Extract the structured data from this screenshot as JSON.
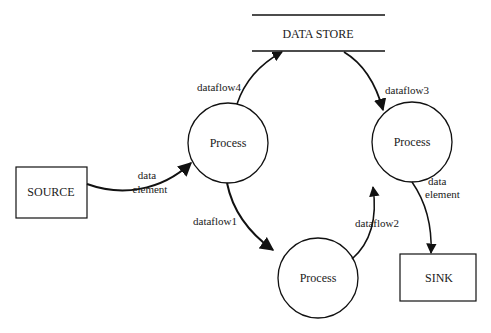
{
  "diagram": {
    "type": "data-flow-diagram",
    "nodes": {
      "data_store": {
        "label": "DATA STORE",
        "kind": "data-store"
      },
      "process_top_left": {
        "label": "Process",
        "kind": "process"
      },
      "process_top_right": {
        "label": "Process",
        "kind": "process"
      },
      "process_bottom": {
        "label": "Process",
        "kind": "process"
      },
      "source": {
        "label": "SOURCE",
        "kind": "external-entity"
      },
      "sink": {
        "label": "SINK",
        "kind": "external-entity"
      }
    },
    "flows": {
      "source_to_process": {
        "line1": "data",
        "line2": "element",
        "from": "SOURCE",
        "to": "Process (top-left)"
      },
      "dataflow4": {
        "label": "dataflow4",
        "from": "Process (top-left)",
        "to": "DATA STORE"
      },
      "dataflow3": {
        "label": "dataflow3",
        "from": "DATA STORE",
        "to": "Process (top-right)"
      },
      "dataflow1": {
        "label": "dataflow1",
        "from": "Process (top-left)",
        "to": "Process (bottom)"
      },
      "dataflow2": {
        "label": "dataflow2",
        "from": "Process (bottom)",
        "to": "Process (top-right)"
      },
      "process_to_sink": {
        "line1": "data",
        "line2": "element",
        "from": "Process (top-right)",
        "to": "SINK"
      }
    }
  }
}
